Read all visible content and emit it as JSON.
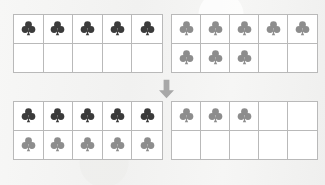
{
  "worksheet": {
    "title": "Make Ten Strategy Ten-Frames",
    "background_color": "#f4f4f3",
    "grid_line_color": "#b9b9b9",
    "cell_fill_color": "#ffffff"
  },
  "tokens": {
    "dark": {
      "name": "dark-club-token",
      "symbol": "club",
      "color": "#3b3b3b"
    },
    "light": {
      "name": "light-club-token",
      "symbol": "club",
      "color": "#8d8d8d"
    }
  },
  "arrow": {
    "name": "down-arrow",
    "direction": "down",
    "color": "#a8a8a8",
    "label": "becomes"
  },
  "frames": [
    {
      "id": "frame-top-left",
      "position": "top-left",
      "rows": 2,
      "columns": 5,
      "capacity": 10,
      "filled_count": 5,
      "cells": [
        "dark",
        "dark",
        "dark",
        "dark",
        "dark",
        "empty",
        "empty",
        "empty",
        "empty",
        "empty"
      ]
    },
    {
      "id": "frame-top-right",
      "position": "top-right",
      "rows": 2,
      "columns": 5,
      "capacity": 10,
      "filled_count": 8,
      "cells": [
        "light",
        "light",
        "light",
        "light",
        "light",
        "light",
        "light",
        "light",
        "empty",
        "empty"
      ]
    },
    {
      "id": "frame-bottom-left",
      "position": "bottom-left",
      "rows": 2,
      "columns": 5,
      "capacity": 10,
      "filled_count": 10,
      "cells": [
        "dark",
        "dark",
        "dark",
        "dark",
        "dark",
        "light",
        "light",
        "light",
        "light",
        "light"
      ]
    },
    {
      "id": "frame-bottom-right",
      "position": "bottom-right",
      "rows": 2,
      "columns": 5,
      "capacity": 10,
      "filled_count": 3,
      "cells": [
        "light",
        "light",
        "light",
        "empty",
        "empty",
        "empty",
        "empty",
        "empty",
        "empty",
        "empty"
      ]
    }
  ],
  "chart_data": {
    "type": "table",
    "categories": [
      "top-left",
      "top-right",
      "bottom-left",
      "bottom-right"
    ],
    "values": [
      5,
      8,
      10,
      3
    ],
    "series": [
      {
        "name": "dark-clubs",
        "values": [
          5,
          0,
          5,
          0
        ]
      },
      {
        "name": "light-clubs",
        "values": [
          0,
          8,
          5,
          3
        ]
      }
    ],
    "xlabel": "Ten-frame",
    "ylabel": "Counters",
    "ylim": [
      0,
      10
    ]
  }
}
